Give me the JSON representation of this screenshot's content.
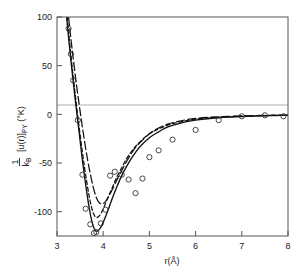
{
  "figure": {
    "background": "#ffffff",
    "frame_color": "#555555",
    "curve_color": "#111111",
    "marker_color": "#333333",
    "zero_line_color": "#999999"
  },
  "chart_data": {
    "type": "line",
    "title": "",
    "subtitle": "",
    "xlabel": "r(Å)",
    "ylabel": "1/k_B [u(r)]_PY (°K)",
    "ylabel_parts": {
      "numerator": "1",
      "denominator": "k",
      "denominator_sub": "B",
      "bracket_open": "[",
      "function": "u(r)",
      "bracket_close": "]",
      "bracket_sub": "PY",
      "units": "(°K)",
      "degree": "°"
    },
    "xlim": [
      3,
      8
    ],
    "ylim": [
      -125,
      100
    ],
    "xticks": [
      3,
      4,
      5,
      6,
      7,
      8
    ],
    "xtick_labels": [
      "3",
      "4",
      "5",
      "6",
      "7",
      "8"
    ],
    "yticks": [
      100,
      50,
      0,
      -50,
      -100
    ],
    "ytick_labels": [
      "100",
      "50",
      "0",
      "-50",
      "-100"
    ],
    "grid": false,
    "legend": "none",
    "zero_line": 0,
    "series": [
      {
        "name": "solid curve",
        "style": "solid",
        "x": [
          3.05,
          3.1,
          3.15,
          3.2,
          3.25,
          3.3,
          3.35,
          3.4,
          3.45,
          3.5,
          3.55,
          3.6,
          3.65,
          3.7,
          3.75,
          3.8,
          3.85,
          3.9,
          3.95,
          4.0,
          4.1,
          4.2,
          4.3,
          4.4,
          4.5,
          4.6,
          4.7,
          4.8,
          5.0,
          5.2,
          5.4,
          5.6,
          5.8,
          6.0,
          6.25,
          6.5,
          6.75,
          7.0,
          7.25,
          7.5,
          7.75,
          8.0
        ],
        "y": [
          190,
          160,
          131,
          104,
          79,
          56,
          34,
          13,
          -7,
          -27,
          -47,
          -65,
          -82,
          -97,
          -109,
          -117,
          -120,
          -119,
          -116,
          -111,
          -99,
          -86,
          -74,
          -63,
          -54,
          -46,
          -39,
          -33,
          -24,
          -18,
          -13,
          -10,
          -7.5,
          -6,
          -4.5,
          -3.5,
          -2.8,
          -2.2,
          -1.8,
          -1.5,
          -1.2,
          -1.0
        ]
      },
      {
        "name": "short-dashed curve",
        "style": "dashed",
        "x": [
          3.1,
          3.15,
          3.2,
          3.25,
          3.3,
          3.35,
          3.4,
          3.45,
          3.5,
          3.55,
          3.6,
          3.65,
          3.7,
          3.75,
          3.8,
          3.85,
          3.9,
          3.95,
          4.0,
          4.1,
          4.2,
          4.3,
          4.4,
          4.5,
          4.6,
          4.7,
          4.8,
          5.0,
          5.2,
          5.4,
          5.6,
          5.8,
          6.0,
          6.25,
          6.5,
          6.75,
          7.0,
          7.25,
          7.5,
          7.75,
          8.0
        ],
        "y": [
          168,
          138,
          110,
          85,
          61,
          39,
          18,
          -2,
          -21,
          -39,
          -56,
          -71,
          -85,
          -96,
          -103,
          -106,
          -105,
          -102,
          -97,
          -86,
          -75,
          -64,
          -55,
          -46,
          -39,
          -33,
          -28,
          -20,
          -15,
          -11,
          -8.5,
          -6.5,
          -5,
          -3.8,
          -3,
          -2.4,
          -1.9,
          -1.6,
          -1.3,
          -1.1,
          -0.9
        ]
      },
      {
        "name": "long-dashed curve",
        "style": "longdash",
        "x": [
          3.12,
          3.18,
          3.24,
          3.3,
          3.36,
          3.42,
          3.48,
          3.54,
          3.6,
          3.66,
          3.72,
          3.78,
          3.84,
          3.9,
          3.96,
          4.02,
          4.1,
          4.2,
          4.3,
          4.4,
          4.5,
          4.6,
          4.7,
          4.8,
          5.0,
          5.2,
          5.4,
          5.6,
          5.8,
          6.0,
          6.25,
          6.5,
          6.75,
          7.0,
          7.25,
          7.5,
          7.75,
          8.0
        ],
        "y": [
          170,
          135,
          105,
          78,
          54,
          31,
          10,
          -10,
          -29,
          -46,
          -61,
          -74,
          -84,
          -90,
          -92,
          -91,
          -86,
          -77,
          -67,
          -58,
          -49,
          -41,
          -34,
          -29,
          -20,
          -14,
          -10,
          -7.5,
          -5.5,
          -4.2,
          -3.2,
          -2.5,
          -2,
          -1.6,
          -1.3,
          -1.1,
          -0.9,
          -0.8
        ]
      }
    ],
    "scatter": {
      "name": "experimental points",
      "marker": "open-circle",
      "x": [
        3.25,
        3.3,
        3.35,
        3.45,
        3.55,
        3.62,
        3.72,
        3.8,
        3.85,
        3.95,
        4.05,
        4.15,
        4.25,
        4.4,
        4.55,
        4.7,
        4.85,
        5.0,
        5.2,
        5.5,
        6.0,
        6.5,
        7.0,
        7.5,
        7.9
      ],
      "y": [
        88,
        62,
        35,
        -6,
        -62,
        -97,
        -113,
        -122,
        -121,
        -112,
        -98,
        -63,
        -59,
        -62,
        -67,
        -81,
        -66,
        -44,
        -37,
        -26,
        -16,
        -6,
        -2,
        -1,
        -2
      ]
    }
  }
}
